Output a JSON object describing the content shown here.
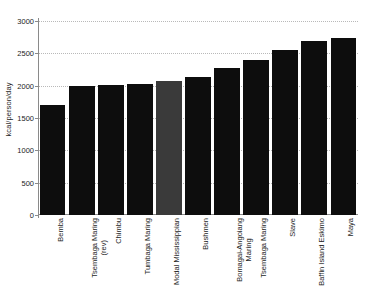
{
  "chart_data": {
    "type": "bar",
    "title": "",
    "subtitle": "",
    "xlabel": "",
    "ylabel": "kcal/person/day",
    "ylim": [
      0,
      3000
    ],
    "yticks": [
      0,
      500,
      1000,
      1500,
      2000,
      2500,
      3000
    ],
    "ytick_labels": [
      "0",
      "500",
      "1000",
      "1500",
      "2000",
      "2500",
      "3000"
    ],
    "grid": "horizontal-dotted",
    "legend": "none",
    "categories": [
      "Bemba",
      "Tsembaga Maring (rev)",
      "Chimbu",
      "Tumbaga Maring",
      "Modal Mississippian",
      "Bushmen",
      "Bomagai-Angoiang Maring",
      "Tsembaga Maring",
      "Slave",
      "Baffin Island Eskimo",
      "Maya"
    ],
    "category_lines": [
      [
        "Bemba"
      ],
      [
        "Tsembaga Maring",
        "(rev)"
      ],
      [
        "Chimbu"
      ],
      [
        "Tumbaga Maring"
      ],
      [
        "Modal Mississippian"
      ],
      [
        "Bushmen"
      ],
      [
        "Bomagai-Angoiang",
        "Maring"
      ],
      [
        "Tsembaga Maring"
      ],
      [
        "Slave"
      ],
      [
        "Baffin Island Eskimo"
      ],
      [
        "Maya"
      ]
    ],
    "values": [
      1700,
      2000,
      2015,
      2025,
      2070,
      2130,
      2270,
      2400,
      2550,
      2690,
      2740
    ],
    "bar_colors": [
      "#0d0d0d",
      "#0d0d0d",
      "#0d0d0d",
      "#0d0d0d",
      "#3a3a3a",
      "#0d0d0d",
      "#0d0d0d",
      "#0d0d0d",
      "#0d0d0d",
      "#0d0d0d",
      "#0d0d0d"
    ],
    "highlight_index": 4,
    "highlight_color": "#3a3a3a",
    "default_bar_color": "#0d0d0d",
    "axis_color": "#8a8a8a",
    "gridline_color": "#b9b9b9"
  },
  "corner": {
    "mark": ""
  }
}
